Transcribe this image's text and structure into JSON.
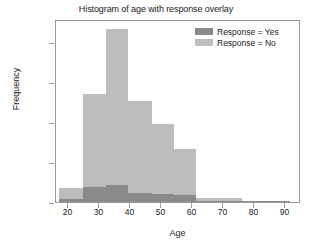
{
  "chart_data": {
    "type": "bar",
    "title": "Histogram of age with response overlay",
    "xlabel": "Age",
    "ylabel": "Frequency",
    "xlim": [
      16,
      95
    ],
    "ylim": [
      0,
      9150
    ],
    "grid": false,
    "legend_position": "top-right",
    "xticks": [
      20,
      30,
      40,
      50,
      60,
      70,
      80,
      90
    ],
    "xtick_labels": [
      "20",
      "30",
      "40",
      "50",
      "60",
      "70",
      "80",
      "90"
    ],
    "yticks": [
      0,
      2000,
      4000,
      6000,
      8000
    ],
    "ytick_labels": [
      "0",
      "2000",
      "4000",
      "6000",
      "8000"
    ],
    "bin_edges": [
      17,
      24.7,
      32.2,
      39.3,
      46.8,
      54.0,
      61.2,
      68.7,
      76.1,
      83.6,
      91.5
    ],
    "series": [
      {
        "name": "Response = No",
        "color": "#bdbdbd",
        "values": [
          700,
          5380,
          8650,
          5060,
          3900,
          2660,
          220,
          210,
          60,
          15
        ]
      },
      {
        "name": "Response = Yes",
        "color": "#8a8a8a",
        "values": [
          130,
          740,
          860,
          430,
          400,
          330,
          60,
          50,
          20,
          5
        ]
      }
    ]
  },
  "legend": {
    "items": [
      {
        "label": "Response = Yes",
        "color": "#8a8a8a"
      },
      {
        "label": "Response = No",
        "color": "#bdbdbd"
      }
    ]
  }
}
